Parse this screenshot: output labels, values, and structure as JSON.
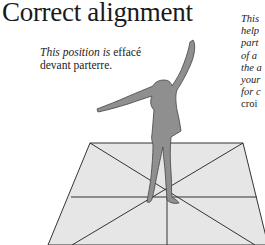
{
  "page": {
    "title": "Correct alignment",
    "caption": {
      "italic_part": "This position is",
      "roman_part": " effacé",
      "line2": "devant parterre."
    },
    "side_text": {
      "lines_italic": [
        "This",
        "help",
        "part",
        "of a",
        "the a",
        "your",
        "for c"
      ],
      "line_roman": "croi"
    }
  },
  "figure": {
    "silhouette_color": "#8f8f8f",
    "floor_color": "#e6e6e6",
    "line_color": "#333333"
  }
}
